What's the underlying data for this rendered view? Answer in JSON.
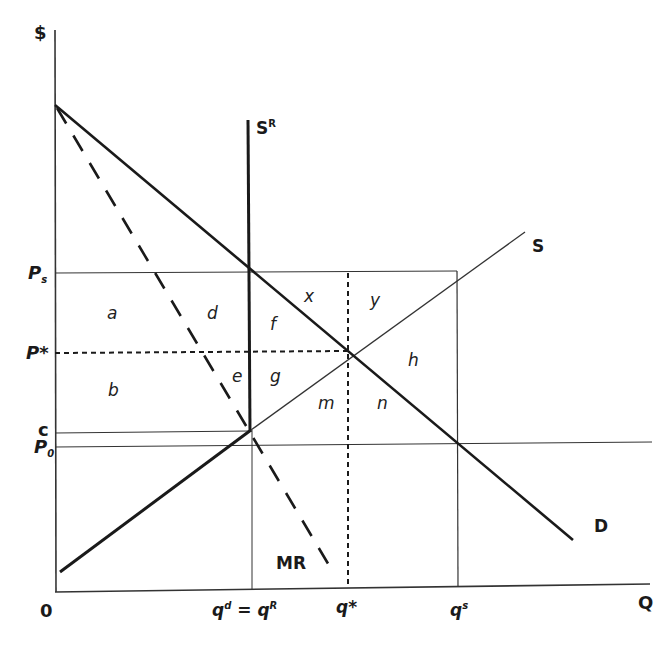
{
  "diagram": {
    "title": "",
    "axes": {
      "y_label": "$",
      "x_label": "Q",
      "origin_label": "0"
    },
    "curves": {
      "demand": "D",
      "supply": "S",
      "restricted_supply": "S",
      "restricted_supply_sup": "R",
      "marginal_revenue": "MR"
    },
    "price_levels": {
      "ps": "P",
      "ps_sub": "s",
      "p_star": "P*",
      "c": "c",
      "p0": "P",
      "p0_sub": "0"
    },
    "quantity_levels": {
      "qd": "q",
      "qd_sup": "d",
      "eq": " = ",
      "qr": "q",
      "qr_sup": "R",
      "q_star": "q*",
      "qs": "q",
      "qs_sup": "s"
    },
    "areas": {
      "a": "a",
      "b": "b",
      "d": "d",
      "e": "e",
      "f": "f",
      "g": "g",
      "x": "x",
      "y": "y",
      "h": "h",
      "m": "m",
      "n": "n"
    },
    "colors": {
      "line": "#1a1a1a",
      "thin_line": "#333333",
      "background": "#ffffff"
    }
  }
}
